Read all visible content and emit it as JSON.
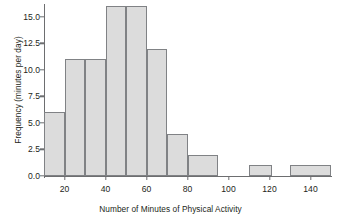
{
  "chart_data": {
    "type": "bar",
    "title": "",
    "xlabel": "Number of Minutes of Physical Activity",
    "ylabel": "Frequency (minutes per day)",
    "xlim": [
      10,
      150
    ],
    "ylim": [
      0,
      16
    ],
    "grid": false,
    "legend": null,
    "bin_width": 10,
    "bar_fill_color": "#dcdcdc",
    "bar_edge_color": "#808285",
    "axis_color": "#6d6e70",
    "xticks": [
      20,
      40,
      60,
      80,
      100,
      120,
      140
    ],
    "xtick_labels": [
      "20",
      "40",
      "60",
      "80",
      "100",
      "120",
      "140"
    ],
    "yticks": [
      0,
      2.5,
      5,
      7.5,
      10,
      12.5,
      15
    ],
    "ytick_labels": [
      "0.0",
      "2.5",
      "5.0",
      "7.5",
      "10.0",
      "12.5",
      "15.0"
    ],
    "bins": [
      {
        "start": 10,
        "end": 20,
        "value": 6
      },
      {
        "start": 20,
        "end": 30,
        "value": 11
      },
      {
        "start": 30,
        "end": 40,
        "value": 11
      },
      {
        "start": 40,
        "end": 50,
        "value": 16
      },
      {
        "start": 50,
        "end": 60,
        "value": 16
      },
      {
        "start": 60,
        "end": 70,
        "value": 12
      },
      {
        "start": 70,
        "end": 80,
        "value": 4
      },
      {
        "start": 80,
        "end": 95,
        "value": 2
      },
      {
        "start": 110,
        "end": 121,
        "value": 1
      },
      {
        "start": 130,
        "end": 150,
        "value": 1
      }
    ],
    "categories": [
      "10-20",
      "20-30",
      "30-40",
      "40-50",
      "50-60",
      "60-70",
      "70-80",
      "80-95",
      "110-121",
      "130-150"
    ],
    "values": [
      6,
      11,
      11,
      16,
      16,
      12,
      4,
      2,
      1,
      1
    ]
  }
}
